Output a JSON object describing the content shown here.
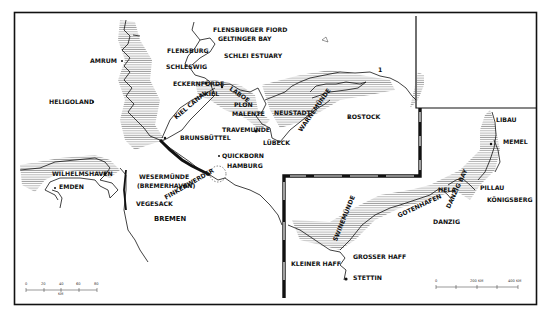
{
  "map": {
    "type": "historical coastline map",
    "colors": {
      "ink": "#111111",
      "hatch": "#555555",
      "background": "#ffffff"
    },
    "labels": {
      "flensburger_fiord": "FLENSBURGER FIORD",
      "geltinger_bay": "GELTINGER BAY",
      "flensburg": "FLENSBURG",
      "schlei_estuary": "SCHLEI ESTUARY",
      "schleswig": "SCHLESWIG",
      "amrum": "AMRUM",
      "eckernforde": "ECKERNFÖRDE",
      "kiel": "KIEL",
      "laboe": "LABOE",
      "kiel_canal": "KIEL CANAL",
      "heligoland": "HELIGOLAND",
      "plon": "PLON",
      "malente": "MALENTE",
      "neustadt": "NEUSTADT",
      "travemunde": "TRAVEMUNDE",
      "lubeck": "LÜBECK",
      "warnemunde": "WARNEMÜNDE",
      "rostock": "ROSTOCK",
      "brunsbuttel": "BRUNSBÜTTEL",
      "quickborn": "QUICKBORN",
      "hamburg": "HAMBURG",
      "wilhelmshaven": "WILHELMSHAVEN",
      "emden": "EMDEN",
      "wesermunde": "WESERMÜNDE",
      "bremerhaven": "(BREMERHAVEN)",
      "finkenwerder": "FINKENWERDER",
      "vegesack": "VEGESACK",
      "bremen": "BREMEN",
      "marker_1": "1",
      "libau": "LIBAU",
      "memel": "MEMEL",
      "hela": "HELA",
      "danzig_bay": "DANZIG BAY",
      "pillau": "PILLAU",
      "konigsberg": "KÖNIGSBERG",
      "gotenhafen": "GOTENHAFEN",
      "danzig": "DANZIG",
      "swinemunde": "SWINEMÜNDE",
      "grosser_haff": "GROSSER HAFF",
      "kleiner_haff": "KLEINER HAFF",
      "stettin": "STETTIN"
    },
    "scale_left": {
      "ticks": [
        "0",
        "20",
        "40",
        "60",
        "80"
      ],
      "unit": "KM"
    },
    "scale_right": {
      "ticks": [
        "0",
        "200 KM",
        "400 KM"
      ]
    }
  }
}
